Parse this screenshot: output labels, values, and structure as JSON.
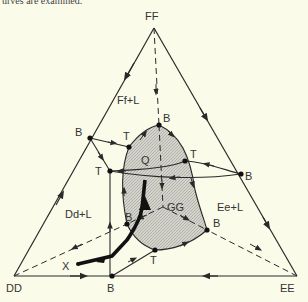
{
  "caption_fragment": "urves are examined.",
  "colors": {
    "background": "#fbfbea",
    "line": "#2a2a2a",
    "shade": "#c8c8c0"
  },
  "vertices": {
    "top": {
      "label": "FF"
    },
    "left": {
      "label": "DD"
    },
    "right": {
      "label": "EE"
    }
  },
  "regions": {
    "ff_l": "Ff+L",
    "dd_l": "Dd+L",
    "ee_l": "Ee+L",
    "gg": "GG"
  },
  "points": {
    "b_top": "B",
    "b_left_edge": "B",
    "b_right_edge": "B",
    "b_inner_left": "B",
    "b_inner_right": "B",
    "b_bottom_edge": "B",
    "t_upper": "T",
    "t_left": "T",
    "t_right": "T",
    "t_bottom": "T",
    "q": "Q",
    "x": "X"
  }
}
